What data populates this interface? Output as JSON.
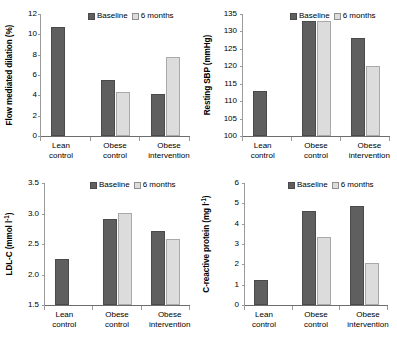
{
  "figure": {
    "legend": {
      "baseline_label": "Baseline",
      "months6_label": "6 months"
    },
    "colors": {
      "baseline": "#5f5f5f",
      "months6": "#dcdcdc",
      "axis": "#9a9a9a"
    }
  },
  "chart_data": [
    {
      "id": "flow-mediated-dilation",
      "type": "bar",
      "title": "",
      "xlabel": "",
      "ylabel": "Flow mediated dilation (%)",
      "ylim": [
        0,
        12
      ],
      "yticks": [
        0,
        2,
        4,
        6,
        8,
        10,
        12
      ],
      "ytick_labels": [
        "0",
        "2",
        "4",
        "6",
        "8",
        "10",
        "12"
      ],
      "grid": false,
      "legend_position": "top-right",
      "categories": [
        "Lean\ncontrol",
        "Obese\ncontrol",
        "Obese\nintervention"
      ],
      "series": [
        {
          "name": "Baseline",
          "values": [
            10.7,
            5.5,
            4.15
          ]
        },
        {
          "name": "6 months",
          "values": [
            null,
            4.35,
            7.75
          ]
        }
      ]
    },
    {
      "id": "resting-sbp",
      "type": "bar",
      "title": "",
      "xlabel": "",
      "ylabel": "Resting SBP (mmHg)",
      "ylim": [
        100,
        135
      ],
      "yticks": [
        100,
        105,
        110,
        115,
        120,
        125,
        130,
        135
      ],
      "ytick_labels": [
        "100",
        "105",
        "110",
        "115",
        "120",
        "125",
        "130",
        "135"
      ],
      "grid": false,
      "legend_position": "top-right",
      "categories": [
        "Lean\ncontrol",
        "Obese\ncontrol",
        "Obese\nintervention"
      ],
      "series": [
        {
          "name": "Baseline",
          "values": [
            113,
            133,
            128
          ]
        },
        {
          "name": "6 months",
          "values": [
            null,
            133,
            120
          ]
        }
      ]
    },
    {
      "id": "ldl-c",
      "type": "bar",
      "title": "",
      "xlabel": "",
      "ylabel": "LDL-C (mmol l-1)",
      "ylim": [
        1.5,
        3.5
      ],
      "yticks": [
        1.5,
        2.0,
        2.5,
        3.0,
        3.5
      ],
      "ytick_labels": [
        "1.5",
        "2.0",
        "2.5",
        "3.0",
        "3.5"
      ],
      "grid": false,
      "legend_position": "top-right",
      "categories": [
        "Lean\ncontrol",
        "Obese\ncontrol",
        "Obese\nintervention"
      ],
      "series": [
        {
          "name": "Baseline",
          "values": [
            2.26,
            2.91,
            2.72
          ]
        },
        {
          "name": "6 months",
          "values": [
            null,
            3.01,
            2.58
          ]
        }
      ]
    },
    {
      "id": "c-reactive-protein",
      "type": "bar",
      "title": "",
      "xlabel": "",
      "ylabel": "C-reactive protein (mg l-1)",
      "ylim": [
        0,
        6
      ],
      "yticks": [
        0,
        1,
        2,
        3,
        4,
        5,
        6
      ],
      "ytick_labels": [
        "0",
        "1",
        "2",
        "3",
        "4",
        "5",
        "6"
      ],
      "grid": false,
      "legend_position": "top-right",
      "categories": [
        "Lean\ncontrol",
        "Obese\ncontrol",
        "Obese\nintervention"
      ],
      "series": [
        {
          "name": "Baseline",
          "values": [
            1.25,
            4.6,
            4.85
          ]
        },
        {
          "name": "6 months",
          "values": [
            null,
            3.35,
            2.05
          ]
        }
      ]
    }
  ]
}
